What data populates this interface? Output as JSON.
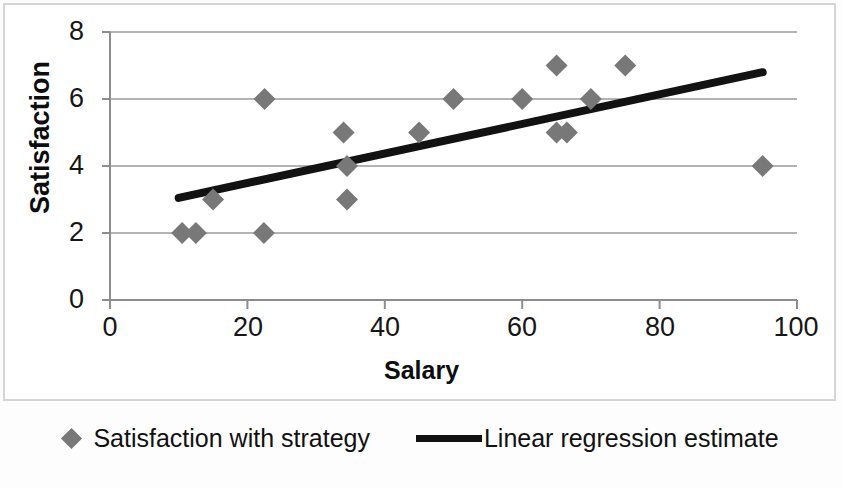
{
  "chart_data": {
    "type": "scatter",
    "title": "",
    "xlabel": "Salary",
    "ylabel": "Satisfaction",
    "xlim": [
      0,
      100
    ],
    "ylim": [
      0,
      8
    ],
    "xticks": [
      "0",
      "20",
      "40",
      "60",
      "80",
      "100"
    ],
    "yticks": [
      "0",
      "2",
      "4",
      "6",
      "8"
    ],
    "grid": "horizontal",
    "legend_position": "bottom",
    "series": [
      {
        "name": "Satisfaction with strategy",
        "type": "scatter",
        "marker": "diamond",
        "color": "#787878",
        "points": [
          [
            10.5,
            2
          ],
          [
            12.5,
            2
          ],
          [
            15.0,
            3
          ],
          [
            22.5,
            6
          ],
          [
            22.4,
            2
          ],
          [
            34.0,
            5
          ],
          [
            34.5,
            4
          ],
          [
            34.5,
            3
          ],
          [
            45.0,
            5
          ],
          [
            50.0,
            6
          ],
          [
            60.0,
            6
          ],
          [
            65.0,
            7
          ],
          [
            65.0,
            5
          ],
          [
            66.5,
            5
          ],
          [
            70.0,
            6
          ],
          [
            75.0,
            7
          ],
          [
            95.0,
            4
          ]
        ]
      },
      {
        "name": "Linear regression estimate",
        "type": "line",
        "color": "#121212",
        "endpoints": [
          [
            10,
            3.05
          ],
          [
            95,
            6.8
          ]
        ]
      }
    ]
  },
  "axis": {
    "y_title": "Satisfaction",
    "x_title": "Salary"
  },
  "legend": {
    "items": [
      {
        "label": "Satisfaction with strategy",
        "marker": "diamond-marker-icon",
        "color": "#787878"
      },
      {
        "label": "Linear regression estimate",
        "marker": "line-marker-icon",
        "color": "#121212"
      }
    ]
  }
}
